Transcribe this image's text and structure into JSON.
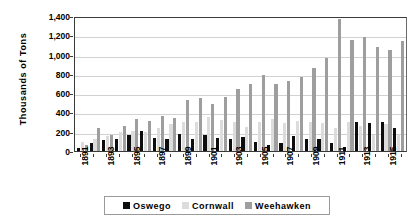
{
  "chart_data": {
    "type": "bar",
    "title": "",
    "xlabel": "",
    "ylabel": "Thousands of Tons",
    "ylim": [
      0,
      1400
    ],
    "ytick_step": 200,
    "yticks": [
      "0",
      "200",
      "400",
      "600",
      "800",
      "1,000",
      "1,200",
      "1,400"
    ],
    "grid": true,
    "legend_position": "bottom",
    "categories": [
      "1891",
      "1892",
      "1893",
      "1894",
      "1895",
      "1896",
      "1897",
      "1898",
      "1899",
      "1900",
      "1901",
      "1902",
      "1903",
      "1904",
      "1905",
      "1906",
      "1907",
      "1908",
      "1909",
      "1910",
      "1911",
      "1912",
      "1913",
      "1914",
      "1915",
      "1916"
    ],
    "xtick_labels": [
      "1891",
      "",
      "1893",
      "",
      "1895",
      "",
      "1897",
      "",
      "1899",
      "",
      "1901",
      "",
      "1903",
      "",
      "1905",
      "",
      "1907",
      "",
      "1909",
      "",
      "1911",
      "",
      "1913",
      "",
      "1915",
      ""
    ],
    "series": [
      {
        "name": "Oswego",
        "color": "#0d0d0d",
        "values": [
          30,
          85,
          115,
          125,
          165,
          205,
          135,
          120,
          175,
          125,
          165,
          130,
          120,
          145,
          95,
          60,
          85,
          155,
          120,
          125,
          85,
          45,
          300,
          295,
          300,
          240
        ]
      },
      {
        "name": "Cornwall",
        "color": "#dcdcdc",
        "values": [
          95,
          120,
          155,
          195,
          205,
          200,
          235,
          280,
          300,
          300,
          350,
          320,
          300,
          250,
          305,
          330,
          290,
          310,
          300,
          295,
          240,
          305,
          255,
          165,
          285,
          170
        ]
      },
      {
        "name": "Weehawken",
        "color": "#9e9e9e",
        "values": [
          60,
          235,
          165,
          260,
          330,
          315,
          360,
          345,
          525,
          545,
          490,
          560,
          640,
          700,
          790,
          700,
          730,
          770,
          860,
          960,
          1370,
          1150,
          1180,
          1080,
          1050,
          1140
        ]
      }
    ]
  },
  "legend": {
    "items": [
      {
        "label": "Oswego",
        "color": "#0d0d0d",
        "swatch_icon": "square-swatch-icon"
      },
      {
        "label": "Cornwall",
        "color": "#dcdcdc",
        "swatch_icon": "square-swatch-icon"
      },
      {
        "label": "Weehawken",
        "color": "#9e9e9e",
        "swatch_icon": "square-swatch-icon"
      }
    ]
  }
}
